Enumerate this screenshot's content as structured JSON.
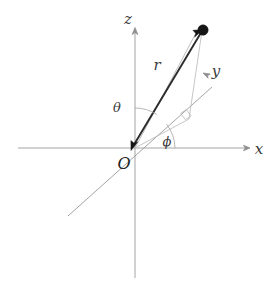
{
  "figure": {
    "background_color": "#ffffff",
    "width": 280,
    "height": 285
  },
  "labels": {
    "z_axis": "z",
    "x_axis": "x",
    "y_axis": "y",
    "radius": "r",
    "polar_angle": "θ",
    "azimuthal_angle": "ϕ",
    "origin": "O"
  },
  "colors": {
    "axis": "#9a9a9a",
    "guide": "#b8b8b8",
    "radius": "#2b2b2b",
    "point": "#151515",
    "text": "#3b3b3b",
    "background": "#ffffff"
  },
  "geometry": {
    "origin": {
      "x": 135,
      "y": 148
    },
    "point_p": {
      "x": 203,
      "y": 30
    },
    "projection_xy": {
      "x": 188,
      "y": 119
    },
    "z_axis_top": {
      "x": 135,
      "y": 30
    },
    "z_axis_bottom": {
      "x": 135,
      "y": 278
    },
    "x_axis_left": {
      "x": 18,
      "y": 148
    },
    "x_axis_right": {
      "x": 247,
      "y": 148
    },
    "y_axis_far": {
      "x": 215,
      "y": 85
    },
    "y_axis_near": {
      "x": 68,
      "y": 216
    }
  },
  "elements": {
    "z_arrowhead": "arrow-up",
    "x_arrowhead": "arrow-right",
    "y_arrowhead": "arrow-up-left",
    "radius_arrowheads": "double-ended",
    "right_angle_marker": "square-corner",
    "theta_arc": "arc-between-z-axis-and-radius",
    "phi_arc": "arc-between-x-axis-and-projection"
  }
}
